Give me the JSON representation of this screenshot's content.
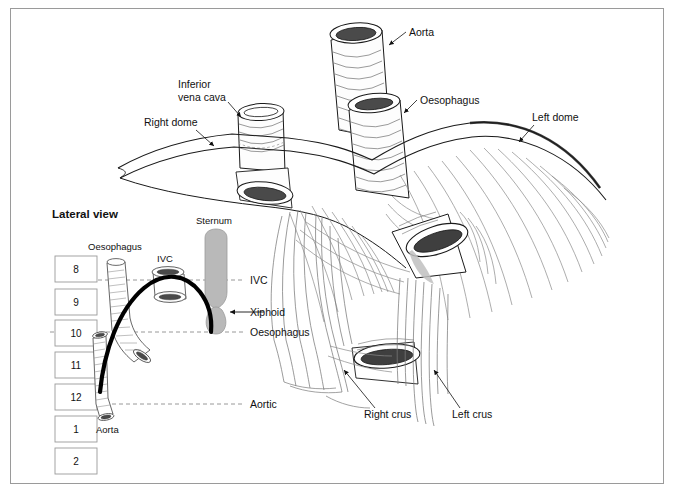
{
  "figure": {
    "title_lateral": "Lateral view",
    "border_color": "#9a9a9a",
    "line_color": "#1a1a1a",
    "hatch_color": "#6e6e6e",
    "lumen_dark": "#4a4a4a",
    "bone_grey": "#b9b9b9",
    "dashed_color": "#8c8c8c"
  },
  "main_view": {
    "labels": {
      "aorta": "Aorta",
      "oesophagus": "Oesophagus",
      "left_dome": "Left dome",
      "right_dome": "Right dome",
      "inferior_vena_cava_line1": "Inferior",
      "inferior_vena_cava_line2": "vena cava",
      "right_crus": "Right crus",
      "left_crus": "Left crus"
    }
  },
  "lateral_view": {
    "title": "Lateral view",
    "structure_labels": {
      "oesophagus": "Oesophagus",
      "ivc": "IVC",
      "sternum": "Sternum",
      "aorta": "Aorta",
      "xiphoid": "Xiphoid"
    },
    "level_lines": [
      {
        "label": "IVC",
        "y": 280
      },
      {
        "label": "Oesophagus",
        "y": 332
      },
      {
        "label": "Aortic",
        "y": 404
      }
    ],
    "vertebrae": [
      {
        "number": "8",
        "y": 256
      },
      {
        "number": "9",
        "y": 293
      },
      {
        "number": "10",
        "y": 325
      },
      {
        "number": "11",
        "y": 357
      },
      {
        "number": "12",
        "y": 389
      },
      {
        "number": "1",
        "y": 420
      },
      {
        "number": "2",
        "y": 450
      }
    ]
  }
}
